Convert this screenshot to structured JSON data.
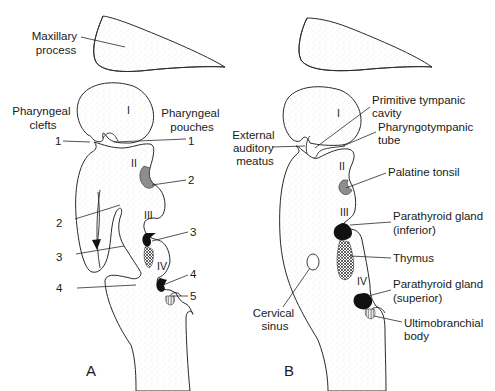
{
  "figure": {
    "panels": [
      {
        "id": "A",
        "label": "A",
        "labels": {
          "maxillary_process": [
            "Maxillary",
            "process"
          ],
          "pharyngeal_clefts": [
            "Pharyngeal",
            "clefts"
          ],
          "pharyngeal_pouches": [
            "Pharyngeal",
            "pouches"
          ]
        },
        "arches": [
          "I",
          "II",
          "III",
          "IV"
        ],
        "cleft_numbers": [
          "1",
          "2",
          "3",
          "4"
        ],
        "pouch_numbers": [
          "1",
          "2",
          "3",
          "4",
          "5"
        ]
      },
      {
        "id": "B",
        "label": "B",
        "arches": [
          "I",
          "II",
          "III",
          "IV"
        ],
        "labels": {
          "primitive_tympanic_cavity": [
            "Primitive tympanic",
            "cavity"
          ],
          "pharyngotympanic_tube": [
            "Pharyngotympanic",
            "tube"
          ],
          "external_auditory_meatus": [
            "External",
            "auditory",
            "meatus"
          ],
          "palatine_tonsil": [
            "Palatine tonsil"
          ],
          "parathyroid_inferior": [
            "Parathyroid gland",
            "(inferior)"
          ],
          "thymus": [
            "Thymus"
          ],
          "parathyroid_superior": [
            "Parathyroid gland",
            "(superior)"
          ],
          "ultimobranchial_body": [
            "Ultimobranchial",
            "body"
          ],
          "cervical_sinus": [
            "Cervical",
            "sinus"
          ]
        }
      }
    ],
    "colors": {
      "line": "#2a2a2a",
      "stipple": "#9a9a9a",
      "dark_fill": "#111111",
      "background": "#ffffff"
    }
  }
}
